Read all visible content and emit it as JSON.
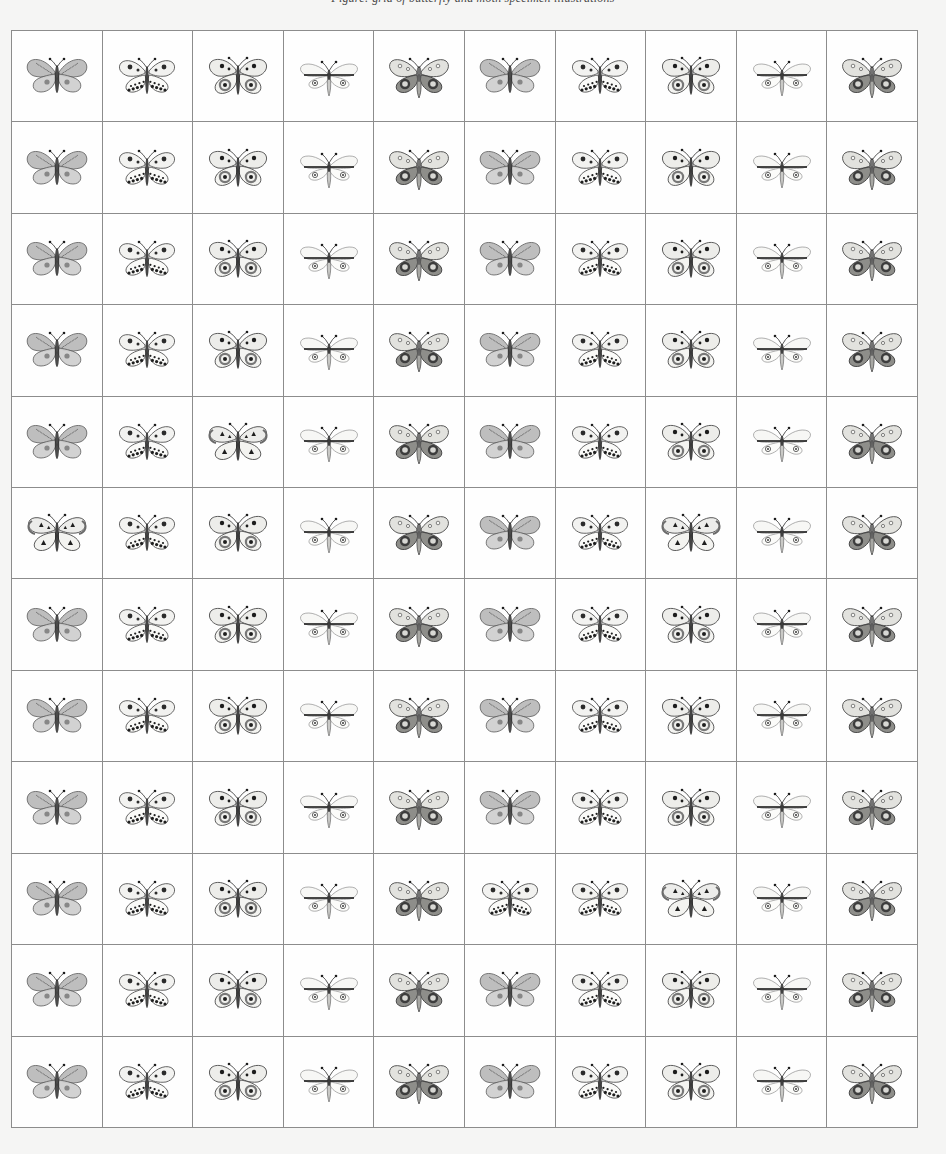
{
  "caption": {
    "text": "Figure: grid of butterfly and moth specimen illustrations"
  },
  "grid": {
    "columns": 10,
    "rows": 12,
    "border_color": "#8c8c8c",
    "cell_background": "#fefefe",
    "page_background": "#f5f5f4",
    "specimen_types": [
      {
        "id": "A",
        "name": "grey-banded-butterfly",
        "description": "broad grey hatched forewings with pale rounded hindwings and two dark dots"
      },
      {
        "id": "B",
        "name": "white-spotted-butterfly",
        "description": "pale wings with scattered dark spots and black speckled hindwing margins"
      },
      {
        "id": "C",
        "name": "ocellated-butterfly",
        "description": "pale wings with large dark concentric eyespots on hindwings"
      },
      {
        "id": "D",
        "name": "pale-narrow-winged-moth",
        "description": "faint narrow swept wings with slender body and long antennae"
      },
      {
        "id": "E",
        "name": "dark-spotted-moth",
        "description": "dark mottled wings with pale spots and heavy rounded hindwing blotches"
      },
      {
        "id": "F",
        "name": "triangle-marked-butterfly",
        "description": "variant with pale wings bearing dark triangular markings"
      }
    ],
    "cells": [
      [
        "A",
        "B",
        "C",
        "D",
        "E",
        "A",
        "B",
        "C",
        "D",
        "E"
      ],
      [
        "A",
        "B",
        "C",
        "D",
        "E",
        "A",
        "B",
        "C",
        "D",
        "E"
      ],
      [
        "A",
        "B",
        "C",
        "D",
        "E",
        "A",
        "B",
        "C",
        "D",
        "E"
      ],
      [
        "A",
        "B",
        "C",
        "D",
        "E",
        "A",
        "B",
        "C",
        "D",
        "E"
      ],
      [
        "A",
        "B",
        "F",
        "D",
        "E",
        "A",
        "B",
        "C",
        "D",
        "E"
      ],
      [
        "F",
        "B",
        "C",
        "D",
        "E",
        "A",
        "B",
        "F",
        "D",
        "E"
      ],
      [
        "A",
        "B",
        "C",
        "D",
        "E",
        "A",
        "B",
        "C",
        "D",
        "E"
      ],
      [
        "A",
        "B",
        "C",
        "D",
        "E",
        "A",
        "B",
        "C",
        "D",
        "E"
      ],
      [
        "A",
        "B",
        "C",
        "D",
        "E",
        "A",
        "B",
        "C",
        "D",
        "E"
      ],
      [
        "A",
        "B",
        "C",
        "D",
        "E",
        "B",
        "B",
        "F",
        "D",
        "E"
      ],
      [
        "A",
        "B",
        "C",
        "D",
        "E",
        "A",
        "B",
        "C",
        "D",
        "E"
      ],
      [
        "A",
        "B",
        "C",
        "D",
        "E",
        "A",
        "B",
        "C",
        "D",
        "E"
      ]
    ]
  }
}
